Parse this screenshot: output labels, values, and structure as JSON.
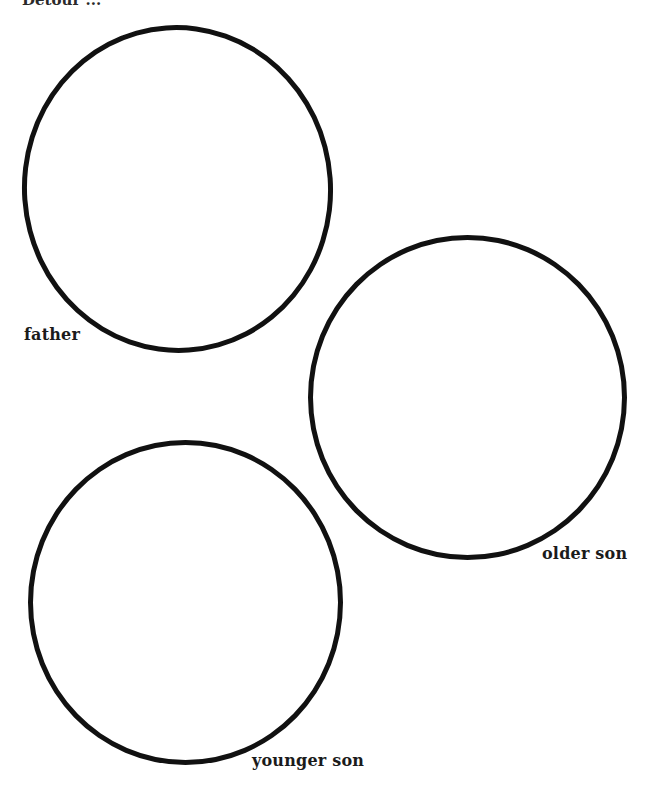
{
  "page": {
    "heading_fragment": "Detour ..."
  },
  "figure": {
    "circles": [
      {
        "id": "father",
        "label": "father"
      },
      {
        "id": "older-son",
        "label": "older son"
      },
      {
        "id": "younger-son",
        "label": "younger son"
      }
    ]
  },
  "colors": {
    "ink": "#111111",
    "paper": "#ffffff"
  }
}
